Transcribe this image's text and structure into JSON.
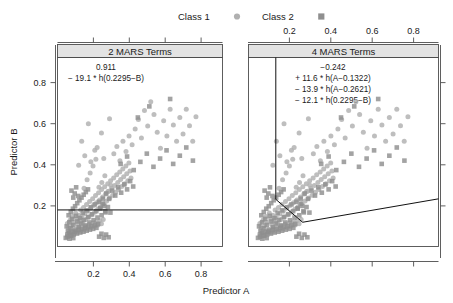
{
  "legend": {
    "items": [
      {
        "label": "Class 1",
        "marker": "circle-marker-icon",
        "color": "#b0b0b0"
      },
      {
        "label": "Class 2",
        "marker": "square-marker-icon",
        "color": "#8f8f8f"
      }
    ]
  },
  "axes": {
    "x_title": "Predictor A",
    "y_title": "Predictor B",
    "x_ticks": [
      "0.2",
      "0.4",
      "0.6",
      "0.8"
    ],
    "y_ticks": [
      "0.2",
      "0.4",
      "0.6",
      "0.8"
    ],
    "x_tick_values": [
      0.2,
      0.4,
      0.6,
      0.8
    ],
    "y_tick_values": [
      0.2,
      0.4,
      0.6,
      0.8
    ],
    "xlim": [
      0.0,
      0.92
    ],
    "ylim": [
      0.0,
      0.92
    ]
  },
  "panels": [
    {
      "strip_label": "2 MARS Terms",
      "equation_lines": [
        "0.911",
        "− 19.1 * h(0.2295−B)"
      ],
      "x_axis_position": "bottom",
      "boundary_type": "horizontal-line"
    },
    {
      "strip_label": "4 MARS Terms",
      "equation_lines": [
        "−0.242",
        "+ 11.6 * h(A−0.1322)",
        "− 13.9 * h(A−0.2621)",
        "− 12.1 * h(0.2295−B)"
      ],
      "x_axis_position": "top",
      "boundary_type": "piecewise-hinge"
    }
  ],
  "chart_data": {
    "type": "scatter",
    "title": "",
    "xlabel": "Predictor A",
    "ylabel": "Predictor B",
    "xlim": [
      0.0,
      0.92
    ],
    "ylim": [
      0.0,
      0.92
    ],
    "grid": false,
    "legend_position": "top",
    "facets": [
      "2 MARS Terms",
      "4 MARS Terms"
    ],
    "series": [
      {
        "name": "Class 1",
        "marker": "circle",
        "color": "#b0b0b0",
        "points": [
          [
            0.055,
            0.112
          ],
          [
            0.062,
            0.091
          ],
          [
            0.071,
            0.129
          ],
          [
            0.078,
            0.101
          ],
          [
            0.084,
            0.146
          ],
          [
            0.09,
            0.118
          ],
          [
            0.096,
            0.084
          ],
          [
            0.101,
            0.163
          ],
          [
            0.107,
            0.134
          ],
          [
            0.112,
            0.107
          ],
          [
            0.118,
            0.152
          ],
          [
            0.123,
            0.126
          ],
          [
            0.129,
            0.178
          ],
          [
            0.134,
            0.143
          ],
          [
            0.14,
            0.115
          ],
          [
            0.145,
            0.19
          ],
          [
            0.151,
            0.158
          ],
          [
            0.157,
            0.131
          ],
          [
            0.162,
            0.205
          ],
          [
            0.168,
            0.171
          ],
          [
            0.173,
            0.142
          ],
          [
            0.179,
            0.219
          ],
          [
            0.184,
            0.186
          ],
          [
            0.19,
            0.155
          ],
          [
            0.196,
            0.232
          ],
          [
            0.201,
            0.199
          ],
          [
            0.207,
            0.167
          ],
          [
            0.212,
            0.248
          ],
          [
            0.218,
            0.213
          ],
          [
            0.224,
            0.181
          ],
          [
            0.229,
            0.262
          ],
          [
            0.235,
            0.226
          ],
          [
            0.24,
            0.194
          ],
          [
            0.246,
            0.277
          ],
          [
            0.252,
            0.241
          ],
          [
            0.257,
            0.208
          ],
          [
            0.263,
            0.291
          ],
          [
            0.268,
            0.255
          ],
          [
            0.274,
            0.222
          ],
          [
            0.28,
            0.306
          ],
          [
            0.285,
            0.269
          ],
          [
            0.291,
            0.236
          ],
          [
            0.296,
            0.32
          ],
          [
            0.302,
            0.283
          ],
          [
            0.308,
            0.25
          ],
          [
            0.313,
            0.334
          ],
          [
            0.319,
            0.297
          ],
          [
            0.324,
            0.264
          ],
          [
            0.33,
            0.349
          ],
          [
            0.336,
            0.312
          ],
          [
            0.341,
            0.278
          ],
          [
            0.347,
            0.363
          ],
          [
            0.352,
            0.326
          ],
          [
            0.358,
            0.292
          ],
          [
            0.364,
            0.377
          ],
          [
            0.369,
            0.34
          ],
          [
            0.375,
            0.306
          ],
          [
            0.381,
            0.392
          ],
          [
            0.386,
            0.354
          ],
          [
            0.392,
            0.32
          ],
          [
            0.398,
            0.406
          ],
          [
            0.404,
            0.368
          ],
          [
            0.41,
            0.334
          ],
          [
            0.148,
            0.283
          ],
          [
            0.165,
            0.325
          ],
          [
            0.182,
            0.358
          ],
          [
            0.198,
            0.392
          ],
          [
            0.214,
            0.425
          ],
          [
            0.231,
            0.288
          ],
          [
            0.247,
            0.312
          ],
          [
            0.264,
            0.345
          ],
          [
            0.281,
            0.268
          ],
          [
            0.297,
            0.298
          ],
          [
            0.314,
            0.452
          ],
          [
            0.331,
            0.487
          ],
          [
            0.348,
            0.418
          ],
          [
            0.365,
            0.512
          ],
          [
            0.382,
            0.462
          ],
          [
            0.399,
            0.538
          ],
          [
            0.416,
            0.495
          ],
          [
            0.433,
            0.572
          ],
          [
            0.451,
            0.618
          ],
          [
            0.468,
            0.528
          ],
          [
            0.485,
            0.662
          ],
          [
            0.503,
            0.586
          ],
          [
            0.52,
            0.705
          ],
          [
            0.538,
            0.642
          ],
          [
            0.556,
            0.556
          ],
          [
            0.574,
            0.478
          ],
          [
            0.592,
            0.612
          ],
          [
            0.61,
            0.538
          ],
          [
            0.628,
            0.668
          ],
          [
            0.646,
            0.592
          ],
          [
            0.664,
            0.512
          ],
          [
            0.682,
            0.628
          ],
          [
            0.7,
            0.548
          ],
          [
            0.718,
            0.668
          ],
          [
            0.736,
            0.588
          ],
          [
            0.754,
            0.512
          ],
          [
            0.772,
            0.632
          ],
          [
            0.068,
            0.068
          ],
          [
            0.079,
            0.075
          ],
          [
            0.088,
            0.062
          ],
          [
            0.099,
            0.082
          ],
          [
            0.109,
            0.069
          ],
          [
            0.119,
            0.089
          ],
          [
            0.128,
            0.074
          ],
          [
            0.138,
            0.095
          ],
          [
            0.148,
            0.081
          ],
          [
            0.158,
            0.101
          ],
          [
            0.167,
            0.086
          ],
          [
            0.177,
            0.108
          ],
          [
            0.187,
            0.093
          ],
          [
            0.197,
            0.114
          ],
          [
            0.206,
            0.099
          ],
          [
            0.216,
            0.12
          ],
          [
            0.226,
            0.105
          ],
          [
            0.236,
            0.126
          ],
          [
            0.245,
            0.111
          ],
          [
            0.255,
            0.132
          ],
          [
            0.135,
            0.512
          ],
          [
            0.172,
            0.598
          ],
          [
            0.208,
            0.468
          ],
          [
            0.245,
            0.552
          ],
          [
            0.29,
            0.622
          ],
          [
            0.118,
            0.396
          ],
          [
            0.152,
            0.442
          ],
          [
            0.186,
            0.412
          ],
          [
            0.221,
            0.482
          ],
          [
            0.258,
            0.428
          ]
        ]
      },
      {
        "name": "Class 2",
        "marker": "square",
        "color": "#8f8f8f",
        "points": [
          [
            0.051,
            0.098
          ],
          [
            0.058,
            0.076
          ],
          [
            0.066,
            0.118
          ],
          [
            0.073,
            0.089
          ],
          [
            0.081,
            0.134
          ],
          [
            0.088,
            0.105
          ],
          [
            0.096,
            0.071
          ],
          [
            0.103,
            0.149
          ],
          [
            0.111,
            0.122
          ],
          [
            0.118,
            0.094
          ],
          [
            0.126,
            0.138
          ],
          [
            0.133,
            0.112
          ],
          [
            0.141,
            0.164
          ],
          [
            0.148,
            0.129
          ],
          [
            0.156,
            0.102
          ],
          [
            0.163,
            0.176
          ],
          [
            0.171,
            0.144
          ],
          [
            0.178,
            0.117
          ],
          [
            0.186,
            0.191
          ],
          [
            0.193,
            0.157
          ],
          [
            0.201,
            0.128
          ],
          [
            0.208,
            0.205
          ],
          [
            0.216,
            0.172
          ],
          [
            0.223,
            0.141
          ],
          [
            0.231,
            0.218
          ],
          [
            0.238,
            0.185
          ],
          [
            0.246,
            0.152
          ],
          [
            0.253,
            0.233
          ],
          [
            0.261,
            0.198
          ],
          [
            0.268,
            0.166
          ],
          [
            0.062,
            0.152
          ],
          [
            0.074,
            0.168
          ],
          [
            0.086,
            0.184
          ],
          [
            0.098,
            0.196
          ],
          [
            0.11,
            0.211
          ],
          [
            0.122,
            0.225
          ],
          [
            0.134,
            0.238
          ],
          [
            0.146,
            0.252
          ],
          [
            0.158,
            0.265
          ],
          [
            0.17,
            0.278
          ],
          [
            0.055,
            0.058
          ],
          [
            0.064,
            0.066
          ],
          [
            0.072,
            0.054
          ],
          [
            0.082,
            0.071
          ],
          [
            0.091,
            0.059
          ],
          [
            0.1,
            0.077
          ],
          [
            0.109,
            0.063
          ],
          [
            0.118,
            0.082
          ],
          [
            0.127,
            0.068
          ],
          [
            0.136,
            0.086
          ],
          [
            0.145,
            0.072
          ],
          [
            0.154,
            0.091
          ],
          [
            0.163,
            0.077
          ],
          [
            0.172,
            0.096
          ],
          [
            0.181,
            0.082
          ],
          [
            0.19,
            0.1
          ],
          [
            0.199,
            0.086
          ],
          [
            0.208,
            0.105
          ],
          [
            0.217,
            0.091
          ],
          [
            0.226,
            0.11
          ],
          [
            0.088,
            0.238
          ],
          [
            0.096,
            0.258
          ],
          [
            0.078,
            0.272
          ],
          [
            0.104,
            0.288
          ],
          [
            0.116,
            0.246
          ],
          [
            0.238,
            0.185
          ],
          [
            0.252,
            0.208
          ],
          [
            0.266,
            0.172
          ],
          [
            0.281,
            0.192
          ],
          [
            0.295,
            0.165
          ],
          [
            0.272,
            0.258
          ],
          [
            0.288,
            0.232
          ],
          [
            0.305,
            0.272
          ],
          [
            0.322,
            0.248
          ],
          [
            0.338,
            0.288
          ],
          [
            0.355,
            0.262
          ],
          [
            0.372,
            0.302
          ],
          [
            0.388,
            0.278
          ],
          [
            0.405,
            0.318
          ],
          [
            0.422,
            0.292
          ],
          [
            0.352,
            0.402
          ],
          [
            0.388,
            0.438
          ],
          [
            0.425,
            0.372
          ],
          [
            0.462,
            0.412
          ],
          [
            0.498,
            0.452
          ],
          [
            0.535,
            0.388
          ],
          [
            0.572,
            0.428
          ],
          [
            0.608,
            0.468
          ],
          [
            0.645,
            0.402
          ],
          [
            0.682,
            0.442
          ],
          [
            0.718,
            0.482
          ],
          [
            0.755,
            0.418
          ],
          [
            0.628,
            0.718
          ],
          [
            0.512,
            0.682
          ],
          [
            0.448,
            0.628
          ],
          [
            0.232,
            0.048
          ],
          [
            0.245,
            0.062
          ],
          [
            0.258,
            0.042
          ],
          [
            0.271,
            0.058
          ],
          [
            0.285,
            0.045
          ],
          [
            0.046,
            0.042
          ],
          [
            0.056,
            0.048
          ],
          [
            0.067,
            0.038
          ],
          [
            0.077,
            0.052
          ],
          [
            0.088,
            0.041
          ]
        ]
      }
    ],
    "decision_boundaries": [
      {
        "panel": "2 MARS Terms",
        "description": "horizontal line at Predictor B = 0.2295",
        "type": "line",
        "points": [
          [
            0.0,
            0.178
          ],
          [
            0.92,
            0.178
          ]
        ]
      },
      {
        "panel": "4 MARS Terms",
        "description": "vertical segment at Predictor A = 0.1322 then hinge V down to vertex and up to right edge",
        "type": "polyline",
        "points": [
          [
            0.1322,
            0.92
          ],
          [
            0.1322,
            0.2295
          ],
          [
            0.262,
            0.118
          ],
          [
            0.92,
            0.232
          ]
        ]
      }
    ]
  }
}
